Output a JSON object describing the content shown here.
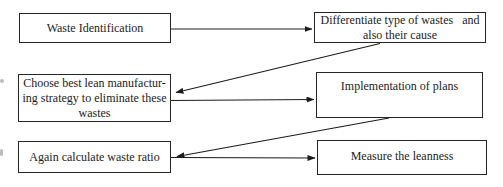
{
  "figure": {
    "type": "flowchart",
    "palette": {
      "background": "#ffffff",
      "ink": "#1c1c1c",
      "border": "#262626"
    },
    "boxes": [
      {
        "id": "waste-identification",
        "label": "Waste Identification"
      },
      {
        "id": "differentiate-wastes",
        "label": "Differentiate type of wastes   and\nalso their cause"
      },
      {
        "id": "choose-strategy",
        "label": "Choose best lean manufactur-\ning strategy to eliminate these\nwastes"
      },
      {
        "id": "implementation",
        "label": "Implementation of plans"
      },
      {
        "id": "recalculate-ratio",
        "label": "Again calculate waste ratio"
      },
      {
        "id": "measure-leanness",
        "label": "Measure the leanness"
      }
    ],
    "connections": [
      {
        "from": "waste-identification",
        "to": "differentiate-wastes"
      },
      {
        "from": "differentiate-wastes",
        "to": "choose-strategy"
      },
      {
        "from": "choose-strategy",
        "to": "implementation"
      },
      {
        "from": "implementation",
        "to": "recalculate-ratio"
      },
      {
        "from": "recalculate-ratio",
        "to": "measure-leanness"
      }
    ]
  }
}
